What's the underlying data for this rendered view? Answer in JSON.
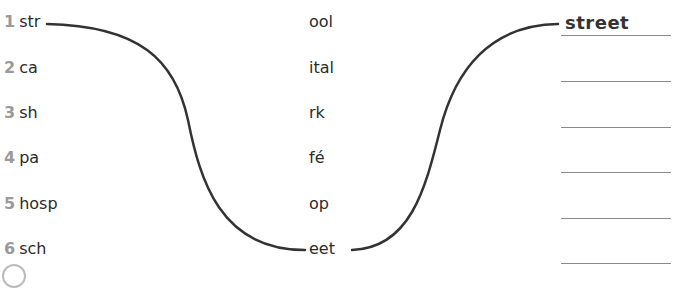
{
  "exercise": {
    "left_column": [
      {
        "number": "1",
        "fragment": "str"
      },
      {
        "number": "2",
        "fragment": "ca"
      },
      {
        "number": "3",
        "fragment": "sh"
      },
      {
        "number": "4",
        "fragment": "pa"
      },
      {
        "number": "5",
        "fragment": "hosp"
      },
      {
        "number": "6",
        "fragment": "sch"
      }
    ],
    "middle_column": [
      "ool",
      "ital",
      "rk",
      "fé",
      "op",
      "eet"
    ],
    "answers": [
      "street",
      "",
      "",
      "",
      "",
      ""
    ],
    "line_color": "#333333",
    "number_color": "#9a9a9a"
  }
}
